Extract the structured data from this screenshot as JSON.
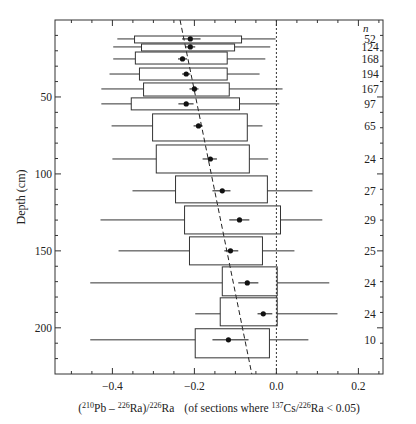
{
  "chart_data": {
    "type": "boxplot",
    "title": "",
    "xlabel": "(210Pb – 226Ra)/226Ra   (of sections where 137Cs/226Ra < 0.05)",
    "xlabel_parts": {
      "open": "(",
      "sup1": "210",
      "t1": "Pb – ",
      "sup2": "226",
      "t2": "Ra)/",
      "sup3": "226",
      "t3": "Ra",
      "note_pre": "(of sections where ",
      "sup4": "137",
      "t4": "Cs/",
      "sup5": "226",
      "t5": "Ra < 0.05)"
    },
    "ylabel": "Depth (cm)",
    "xlim": [
      -0.54,
      0.26
    ],
    "ylim": [
      0,
      230
    ],
    "y_inverted": true,
    "x_ticks": [
      -0.4,
      -0.2,
      0.0,
      0.2
    ],
    "x_tick_labels": [
      "−0.4",
      "−0.2",
      "0.0",
      "0.2"
    ],
    "x_minor_step": 0.05,
    "y_ticks": [
      50,
      100,
      150,
      200
    ],
    "y_tick_labels": [
      "50",
      "100",
      "150",
      "200"
    ],
    "y_minor_step": 10,
    "n_header": "n",
    "reference_line": {
      "x": 0.0,
      "style": "dotted"
    },
    "trend_line": {
      "style": "dashed",
      "points": [
        [
          -0.235,
          0
        ],
        [
          -0.06,
          230
        ]
      ]
    },
    "rows": [
      {
        "depth_top": 10.4,
        "depth_bottom": 14.9,
        "depth": 12.3,
        "box": [
          -0.346,
          -0.085
        ],
        "whisker": [
          -0.388,
          -0.002
        ],
        "mean": -0.21,
        "err": [
          -0.23,
          -0.185
        ],
        "n": "52"
      },
      {
        "depth_top": 15.6,
        "depth_bottom": 20.1,
        "depth": 17.5,
        "box": [
          -0.329,
          -0.102
        ],
        "whisker": [
          -0.398,
          -0.015
        ],
        "mean": -0.21,
        "err": [
          -0.222,
          -0.198
        ],
        "n": "124"
      },
      {
        "depth_top": 20.8,
        "depth_bottom": 28.6,
        "depth": 25.3,
        "box": [
          -0.344,
          -0.12
        ],
        "whisker": [
          -0.398,
          -0.027
        ],
        "mean": -0.229,
        "err": [
          -0.24,
          -0.218
        ],
        "n": "168"
      },
      {
        "depth_top": 31.2,
        "depth_bottom": 39.0,
        "depth": 35.1,
        "box": [
          -0.334,
          -0.12
        ],
        "whisker": [
          -0.407,
          -0.041
        ],
        "mean": -0.22,
        "err": [
          -0.23,
          -0.21
        ],
        "n": "194"
      },
      {
        "depth_top": 40.9,
        "depth_bottom": 49.4,
        "depth": 44.8,
        "box": [
          -0.324,
          -0.115
        ],
        "whisker": [
          -0.427,
          0.015
        ],
        "mean": -0.2,
        "err": [
          -0.212,
          -0.19
        ],
        "n": "167"
      },
      {
        "depth_top": 50.6,
        "depth_bottom": 58.4,
        "depth": 54.5,
        "box": [
          -0.354,
          -0.09
        ],
        "whisker": [
          -0.427,
          0.007
        ],
        "mean": -0.22,
        "err": [
          -0.239,
          -0.202
        ],
        "n": "97"
      },
      {
        "depth_top": 61.0,
        "depth_bottom": 78.6,
        "depth": 68.8,
        "box": [
          -0.302,
          -0.071
        ],
        "whisker": [
          -0.402,
          -0.034
        ],
        "mean": -0.19,
        "err": [
          -0.202,
          -0.18
        ],
        "n": "65"
      },
      {
        "depth_top": 81.2,
        "depth_bottom": 99.4,
        "depth": 90.3,
        "box": [
          -0.293,
          -0.066
        ],
        "whisker": [
          -0.4,
          -0.02
        ],
        "mean": -0.161,
        "err": [
          -0.18,
          -0.145
        ],
        "n": "24"
      },
      {
        "depth_top": 101.3,
        "depth_bottom": 118.8,
        "depth": 111.0,
        "box": [
          -0.246,
          -0.022
        ],
        "whisker": [
          -0.351,
          0.088
        ],
        "mean": -0.132,
        "err": [
          -0.156,
          -0.112
        ],
        "n": "27"
      },
      {
        "depth_top": 120.8,
        "depth_bottom": 139.0,
        "depth": 129.9,
        "box": [
          -0.224,
          0.01
        ],
        "whisker": [
          -0.429,
          0.112
        ],
        "mean": -0.09,
        "err": [
          -0.115,
          -0.066
        ],
        "n": "29"
      },
      {
        "depth_top": 140.9,
        "depth_bottom": 159.1,
        "depth": 150.0,
        "box": [
          -0.212,
          -0.034
        ],
        "whisker": [
          -0.385,
          0.044
        ],
        "mean": -0.112,
        "err": [
          -0.127,
          -0.093
        ],
        "n": "25"
      },
      {
        "depth_top": 160.4,
        "depth_bottom": 179.2,
        "depth": 170.8,
        "box": [
          -0.132,
          0.002
        ],
        "whisker": [
          -0.454,
          0.129
        ],
        "mean": -0.071,
        "err": [
          -0.093,
          -0.044
        ],
        "n": "24"
      },
      {
        "depth_top": 180.5,
        "depth_bottom": 198.7,
        "depth": 190.9,
        "box": [
          -0.137,
          0.002
        ],
        "whisker": [
          -0.198,
          0.149
        ],
        "mean": -0.032,
        "err": [
          -0.046,
          -0.01
        ],
        "n": "24"
      },
      {
        "depth_top": 200.6,
        "depth_bottom": 219.5,
        "depth": 207.8,
        "box": [
          -0.198,
          -0.017
        ],
        "whisker": [
          -0.454,
          0.078
        ],
        "mean": -0.117,
        "err": [
          -0.156,
          -0.068
        ],
        "n": "10"
      }
    ]
  }
}
